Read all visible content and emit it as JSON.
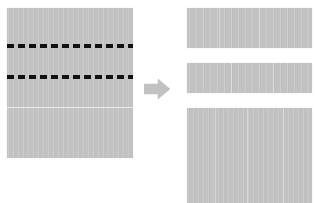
{
  "diagram": {
    "colors": {
      "page_fill": "#c2c2c2",
      "cut_line": "#111111",
      "arrow": "#c2c2c2",
      "background": "#ffffff",
      "seam": "#ffffff"
    }
  },
  "source": {
    "name": "Original page",
    "label": "",
    "cut_lines": [
      {
        "name": "Top cut line",
        "style": "dashed",
        "label": ""
      },
      {
        "name": "Bottom cut line",
        "style": "dashed",
        "label": ""
      }
    ],
    "seam": {
      "name": "Faint horizontal seam",
      "label": ""
    }
  },
  "arrow": {
    "name": "Transform arrow",
    "direction": "right",
    "label": ""
  },
  "results": [
    {
      "name": "Segment 1",
      "label": ""
    },
    {
      "name": "Segment 2",
      "label": ""
    },
    {
      "name": "Segment 3",
      "label": ""
    }
  ]
}
